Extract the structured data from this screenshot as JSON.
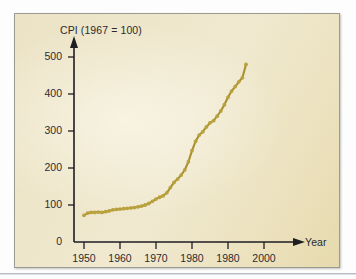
{
  "figure": {
    "panel_border_color": "#9b9b93",
    "panel_bg_start": "#ece3c6",
    "panel_bg_end": "#e6daad",
    "axis_color": "#1d1d22",
    "series_color": "#a8912f",
    "marker_color": "#b9a23d",
    "text_color": "#2b2b2f"
  },
  "chart_data": {
    "type": "line",
    "title": "CPI (1967 = 100)",
    "xlabel": "Year",
    "ylabel": "CPI (1967 = 100)",
    "xlim": [
      1946,
      2002
    ],
    "ylim": [
      0,
      530
    ],
    "grid": false,
    "legend": null,
    "x_tick_labels": [
      "1950",
      "1960",
      "1970",
      "1980",
      "1980",
      "2000"
    ],
    "x_tick_values": [
      1950,
      1960,
      1970,
      1980,
      1990,
      2000
    ],
    "y_tick_labels": [
      "0",
      "100",
      "200",
      "300",
      "400",
      "500"
    ],
    "y_tick_values": [
      0,
      100,
      200,
      300,
      400,
      500
    ],
    "marker": "dot",
    "x": [
      1950,
      1951,
      1952,
      1953,
      1954,
      1955,
      1956,
      1957,
      1958,
      1959,
      1960,
      1961,
      1962,
      1963,
      1964,
      1965,
      1966,
      1967,
      1968,
      1969,
      1970,
      1971,
      1972,
      1973,
      1974,
      1975,
      1976,
      1977,
      1978,
      1979,
      1980,
      1981,
      1982,
      1983,
      1984,
      1985,
      1986,
      1987,
      1988,
      1989,
      1990,
      1991,
      1992,
      1993,
      1994
    ],
    "values": [
      72,
      78,
      80,
      80,
      81,
      80,
      82,
      84,
      87,
      88,
      89,
      90,
      91,
      92,
      93,
      95,
      97,
      100,
      104,
      110,
      116,
      121,
      125,
      133,
      147,
      161,
      170,
      181,
      195,
      217,
      247,
      272,
      289,
      298,
      311,
      322,
      328,
      340,
      354,
      371,
      391,
      408,
      420,
      433,
      444
    ],
    "end_value": 480,
    "annotations": []
  },
  "labels": {
    "y_axis_title": "CPI (1967 = 100)",
    "x_axis_title": "Year"
  }
}
